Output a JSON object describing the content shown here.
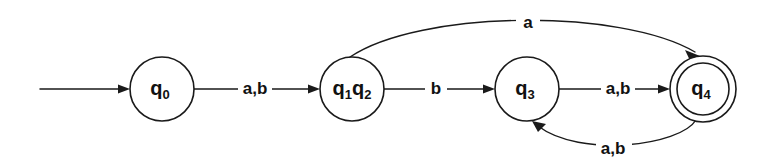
{
  "diagram": {
    "type": "state-machine",
    "background_color": "#ffffff",
    "stroke_color": "#1a1a1a",
    "text_color": "#111111",
    "states": [
      {
        "id": "q0",
        "label_main": "q",
        "label_sub": "0",
        "cx": 162,
        "cy": 89,
        "r": 32,
        "accepting": false,
        "start": true
      },
      {
        "id": "q1q2",
        "label_main_a": "q",
        "label_sub_a": "1",
        "label_main_b": "q",
        "label_sub_b": "2",
        "cx": 352,
        "cy": 89,
        "r": 32,
        "accepting": false,
        "start": false
      },
      {
        "id": "q3",
        "label_main": "q",
        "label_sub": "3",
        "cx": 527,
        "cy": 89,
        "r": 32,
        "accepting": false,
        "start": false
      },
      {
        "id": "q4",
        "label_main": "q",
        "label_sub": "4",
        "cx": 703,
        "cy": 89,
        "r_outer": 33,
        "r_inner": 26,
        "accepting": true,
        "start": false
      }
    ],
    "transitions": [
      {
        "id": "start-arrow",
        "from": "",
        "to": "q0",
        "label": "",
        "shape": "straight"
      },
      {
        "id": "q0-to-q1q2",
        "from": "q0",
        "to": "q1q2",
        "label": "a,b",
        "label_x": 255,
        "label_y": 89,
        "shape": "straight"
      },
      {
        "id": "q1q2-to-q3",
        "from": "q1q2",
        "to": "q3",
        "label": "b",
        "label_x": 436,
        "label_y": 89,
        "shape": "straight"
      },
      {
        "id": "q3-to-q4",
        "from": "q3",
        "to": "q4",
        "label": "a,b",
        "label_x": 618,
        "label_y": 89,
        "shape": "straight"
      },
      {
        "id": "q1q2-to-q4",
        "from": "q1q2",
        "to": "q4",
        "label": "a",
        "label_x": 528,
        "label_y": 23,
        "shape": "arc-top"
      },
      {
        "id": "q4-to-q3",
        "from": "q4",
        "to": "q3",
        "label": "a,b",
        "label_x": 613,
        "label_y": 149,
        "shape": "arc-bottom"
      }
    ]
  }
}
